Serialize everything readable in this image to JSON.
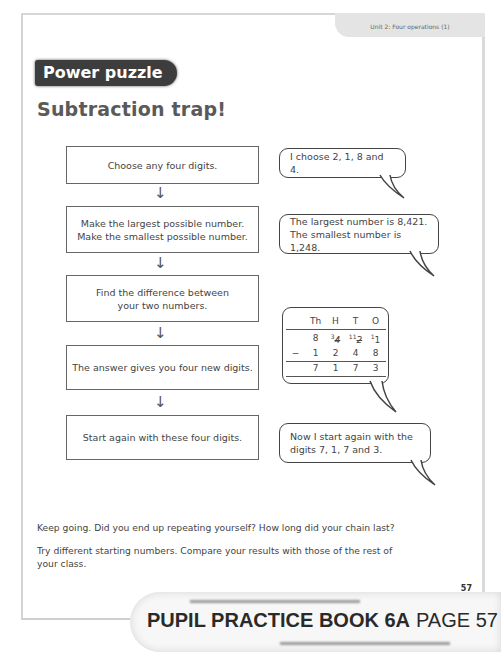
{
  "header": {
    "unit_label": "Unit 2: Four operations (1)"
  },
  "badge": {
    "label": "Power puzzle"
  },
  "title": "Subtraction trap!",
  "steps": [
    {
      "lines": [
        "Choose any four digits."
      ]
    },
    {
      "lines": [
        "Make the largest possible number.",
        "Make the smallest possible number."
      ]
    },
    {
      "lines": [
        "Find the difference between",
        "your two numbers."
      ]
    },
    {
      "lines": [
        "The answer gives you four new digits."
      ]
    },
    {
      "lines": [
        "Start again with these four digits."
      ]
    }
  ],
  "arrow_glyph": "↓",
  "bubbles": [
    {
      "lines": [
        "I choose 2, 1, 8 and 4."
      ]
    },
    {
      "lines": [
        "The largest number is 8,421.",
        "The smallest number is 1,248."
      ]
    },
    {
      "lines": [
        "Now I start again with the",
        "digits 7, 1, 7 and 3."
      ]
    }
  ],
  "subtraction": {
    "headers": [
      "Th",
      "H",
      "T",
      "O"
    ],
    "minuend": [
      "8",
      "4",
      "2",
      "1"
    ],
    "minuend_carries": [
      "",
      "3",
      "11",
      "1"
    ],
    "operator": "−",
    "subtrahend": [
      "1",
      "2",
      "4",
      "8"
    ],
    "result": [
      "7",
      "1",
      "7",
      "3"
    ]
  },
  "body": {
    "para1": "Keep going. Did you end up repeating yourself? How long did your chain last?",
    "para2_line1": "Try different starting numbers. Compare your results with those of the rest of",
    "para2_line2": "your class."
  },
  "page_number": "57",
  "banner": {
    "book": "PUPIL PRACTICE BOOK 6A",
    "page": "PAGE 57"
  }
}
